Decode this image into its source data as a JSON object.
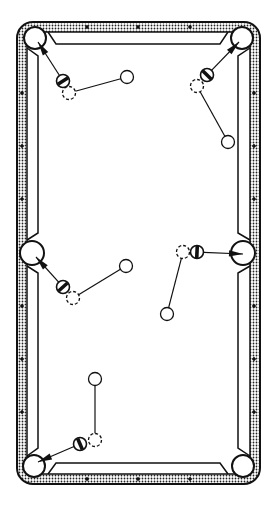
{
  "diagram": {
    "type": "billiards-table-shot-diagram",
    "width": 276,
    "height": 506,
    "colors": {
      "background": "#ffffff",
      "ink": "#111111",
      "rail_stipple": "#222222"
    },
    "table": {
      "outer": {
        "x": 17,
        "y": 22,
        "w": 243,
        "h": 462,
        "r": 16
      },
      "rail_inner": {
        "x": 27,
        "y": 32,
        "w": 223,
        "h": 442,
        "r": 6
      },
      "cushion": {
        "x1": 38,
        "y1": 44,
        "x2": 238,
        "y2": 463
      }
    },
    "pockets": [
      {
        "id": "top-left",
        "cx": 35,
        "cy": 38,
        "r": 11
      },
      {
        "id": "top-right",
        "cx": 242,
        "cy": 38,
        "r": 11
      },
      {
        "id": "middle-left",
        "cx": 32,
        "cy": 253,
        "r": 12
      },
      {
        "id": "middle-right",
        "cx": 243,
        "cy": 253,
        "r": 12
      },
      {
        "id": "bottom-left",
        "cx": 34,
        "cy": 466,
        "r": 11
      },
      {
        "id": "bottom-right",
        "cx": 243,
        "cy": 466,
        "r": 11
      }
    ],
    "diamonds": [
      {
        "cx": 87,
        "cy": 27
      },
      {
        "cx": 138,
        "cy": 27
      },
      {
        "cx": 190,
        "cy": 27
      },
      {
        "cx": 87,
        "cy": 479
      },
      {
        "cx": 138,
        "cy": 479
      },
      {
        "cx": 190,
        "cy": 479
      },
      {
        "cx": 22,
        "cy": 93
      },
      {
        "cx": 22,
        "cy": 146
      },
      {
        "cx": 22,
        "cy": 199
      },
      {
        "cx": 22,
        "cy": 306
      },
      {
        "cx": 22,
        "cy": 359
      },
      {
        "cx": 22,
        "cy": 412
      },
      {
        "cx": 254,
        "cy": 93
      },
      {
        "cx": 254,
        "cy": 146
      },
      {
        "cx": 254,
        "cy": 199
      },
      {
        "cx": 254,
        "cy": 306
      },
      {
        "cx": 254,
        "cy": 359
      },
      {
        "cx": 254,
        "cy": 412
      }
    ],
    "shots": [
      {
        "id": "shot-top-left",
        "cue_ball": {
          "cx": 127,
          "cy": 77
        },
        "ghost_ball": {
          "cx": 69,
          "cy": 93
        },
        "object_ball": {
          "cx": 63,
          "cy": 81
        },
        "target_pocket": "top-left",
        "arrow_tip": {
          "x": 38,
          "y": 42
        }
      },
      {
        "id": "shot-top-right",
        "cue_ball": {
          "cx": 228,
          "cy": 142
        },
        "ghost_ball": {
          "cx": 197,
          "cy": 86
        },
        "object_ball": {
          "cx": 207,
          "cy": 75
        },
        "target_pocket": "top-right",
        "arrow_tip": {
          "x": 239,
          "y": 42
        }
      },
      {
        "id": "shot-middle-left",
        "cue_ball": {
          "cx": 126,
          "cy": 266
        },
        "ghost_ball": {
          "cx": 73,
          "cy": 298
        },
        "object_ball": {
          "cx": 63,
          "cy": 287
        },
        "target_pocket": "middle-left",
        "arrow_tip": {
          "x": 36,
          "y": 257
        }
      },
      {
        "id": "shot-middle-right",
        "cue_ball": {
          "cx": 167,
          "cy": 314
        },
        "ghost_ball": {
          "cx": 183,
          "cy": 252
        },
        "object_ball": {
          "cx": 197,
          "cy": 252
        },
        "target_pocket": "middle-right",
        "arrow_tip": {
          "x": 243,
          "y": 254
        }
      },
      {
        "id": "shot-bottom-left",
        "cue_ball": {
          "cx": 95,
          "cy": 379
        },
        "ghost_ball": {
          "cx": 95,
          "cy": 440
        },
        "object_ball": {
          "cx": 80,
          "cy": 444
        },
        "target_pocket": "bottom-left",
        "arrow_tip": {
          "x": 38,
          "y": 462
        }
      }
    ],
    "ball_radius": 6.5
  }
}
